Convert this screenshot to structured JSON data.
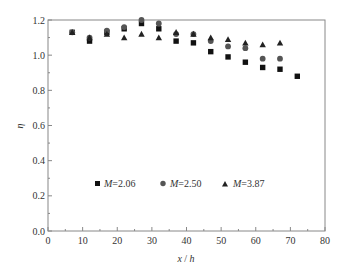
{
  "chart_data": {
    "type": "scatter",
    "title": "",
    "xlabel": "x / h",
    "ylabel": "η",
    "xlim": [
      0,
      80
    ],
    "ylim": [
      0.0,
      1.2
    ],
    "xticks": [
      0,
      10,
      20,
      30,
      40,
      50,
      60,
      70,
      80
    ],
    "yticks": [
      0.0,
      0.2,
      0.4,
      0.6,
      0.8,
      1.0,
      1.2
    ],
    "ytick_labels": [
      "0.0",
      "0.2",
      "0.4",
      "0.6",
      "0.8",
      "1.0",
      "1.2"
    ],
    "grid": false,
    "legend_position": "inside-lower-center",
    "series": [
      {
        "name": "M=2.06",
        "marker": "square",
        "color": "#111111",
        "x": [
          7,
          12,
          17,
          22,
          27,
          32,
          37,
          42,
          47,
          52,
          57,
          62,
          67,
          72
        ],
        "y": [
          1.13,
          1.08,
          1.13,
          1.15,
          1.18,
          1.15,
          1.08,
          1.07,
          1.02,
          0.99,
          0.96,
          0.93,
          0.92,
          0.88
        ]
      },
      {
        "name": "M=2.50",
        "marker": "circle",
        "color": "#555555",
        "x": [
          7,
          12,
          17,
          22,
          27,
          32,
          37,
          42,
          47,
          52,
          57,
          62,
          67
        ],
        "y": [
          1.13,
          1.1,
          1.14,
          1.16,
          1.2,
          1.18,
          1.12,
          1.12,
          1.08,
          1.05,
          1.04,
          0.98,
          0.98
        ]
      },
      {
        "name": "M=3.87",
        "marker": "triangle",
        "color": "#222222",
        "x": [
          7,
          12,
          17,
          22,
          27,
          32,
          37,
          42,
          47,
          52,
          57,
          62,
          67
        ],
        "y": [
          1.13,
          1.1,
          1.12,
          1.1,
          1.12,
          1.1,
          1.13,
          1.12,
          1.1,
          1.09,
          1.07,
          1.06,
          1.07
        ]
      }
    ]
  },
  "legend": {
    "items": [
      {
        "prefix": "M",
        "suffix": "=2.06"
      },
      {
        "prefix": "M",
        "suffix": "=2.50"
      },
      {
        "prefix": "M",
        "suffix": "=3.87"
      }
    ]
  },
  "axes": {
    "xlabel_var": "x",
    "xlabel_sep": " / ",
    "xlabel_den": "h",
    "ylabel": "η"
  }
}
